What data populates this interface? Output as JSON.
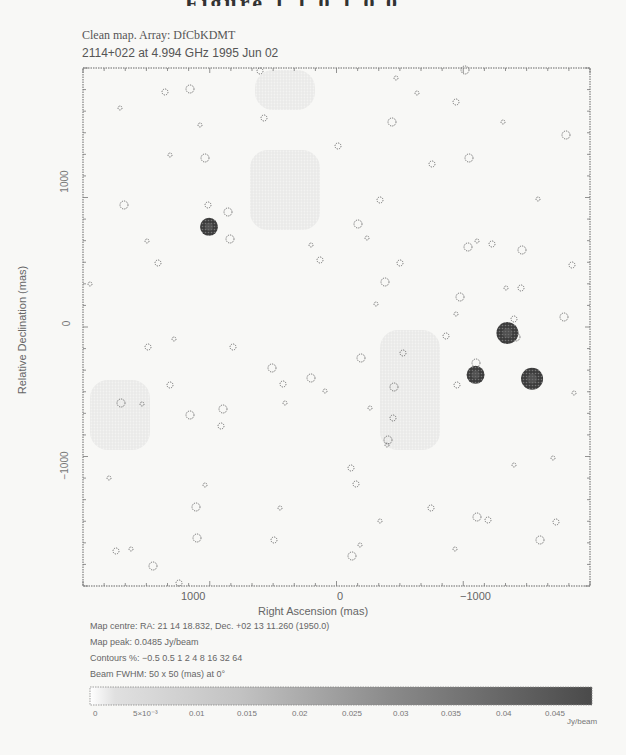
{
  "page": {
    "header_fragment": "Figure  1 1 0 1 0 0"
  },
  "chart_data": {
    "type": "contour-map",
    "title": "Clean map.  Array: DfCbKDMT",
    "subtitle": "2114+022 at 4.994 GHz 1995 Jun 02",
    "xlabel": "Right Ascension   (mas)",
    "ylabel": "Relative Declination   (mas)",
    "xlim": [
      1950,
      -1550
    ],
    "ylim": [
      -1800,
      2050
    ],
    "x_ticks": [
      {
        "value": 1000,
        "label": "1000"
      },
      {
        "value": 0,
        "label": "0"
      },
      {
        "value": -1000,
        "label": "−1000"
      }
    ],
    "y_ticks": [
      {
        "value": 1000,
        "label": "1000"
      },
      {
        "value": 0,
        "label": "0"
      },
      {
        "value": -1000,
        "label": "−1000"
      }
    ],
    "grid": false,
    "bright_sources": [
      {
        "ra_mas": 1080,
        "dec_mas": 870,
        "radius_px": 9
      },
      {
        "ra_mas": -980,
        "dec_mas": 80,
        "radius_px": 11
      },
      {
        "ra_mas": -760,
        "dec_mas": -230,
        "radius_px": 9
      },
      {
        "ra_mas": -1150,
        "dec_mas": -260,
        "radius_px": 11
      }
    ],
    "info": {
      "map_centre": "Map centre:  RA: 21 14 18.832,   Dec. +02 13 11.260 (1950.0)",
      "map_peak": "Map peak: 0.0485 Jy/beam",
      "contours": "Contours %: −0.5 0.5 1 2 4 8 16 32 64",
      "beam": "Beam FWHM: 50 x 50 (mas) at 0°"
    },
    "colorbar": {
      "range": [
        0,
        0.0485
      ],
      "unit": "Jy/beam",
      "ticks": [
        "0",
        "5×10⁻³",
        "0.01",
        "0.015",
        "0.02",
        "0.025",
        "0.03",
        "0.035",
        "0.04",
        "0.045"
      ]
    },
    "contour_noise_blobs": [
      [
        120,
        108
      ],
      [
        165,
        92
      ],
      [
        190,
        89
      ],
      [
        200,
        125
      ],
      [
        260,
        71
      ],
      [
        205,
        158
      ],
      [
        170,
        155
      ],
      [
        208,
        205
      ],
      [
        230,
        239
      ],
      [
        147,
        241
      ],
      [
        158,
        263
      ],
      [
        124,
        205
      ],
      [
        90,
        284
      ],
      [
        264,
        118
      ],
      [
        228,
        212
      ],
      [
        311,
        245
      ],
      [
        320,
        260
      ],
      [
        358,
        224
      ],
      [
        367,
        238
      ],
      [
        400,
        263
      ],
      [
        385,
        282
      ],
      [
        376,
        304
      ],
      [
        380,
        200
      ],
      [
        392,
        122
      ],
      [
        396,
        78
      ],
      [
        338,
        146
      ],
      [
        465,
        70
      ],
      [
        417,
        93
      ],
      [
        456,
        102
      ],
      [
        469,
        158
      ],
      [
        503,
        122
      ],
      [
        432,
        164
      ],
      [
        460,
        297
      ],
      [
        456,
        314
      ],
      [
        446,
        336
      ],
      [
        361,
        358
      ],
      [
        370,
        408
      ],
      [
        403,
        353
      ],
      [
        468,
        247
      ],
      [
        477,
        241
      ],
      [
        492,
        244
      ],
      [
        522,
        250
      ],
      [
        506,
        288
      ],
      [
        521,
        288
      ],
      [
        566,
        135
      ],
      [
        538,
        199
      ],
      [
        572,
        265
      ],
      [
        564,
        317
      ],
      [
        574,
        393
      ],
      [
        514,
        319
      ],
      [
        516,
        337
      ],
      [
        553,
        458
      ],
      [
        556,
        522
      ],
      [
        540,
        540
      ],
      [
        514,
        465
      ],
      [
        488,
        520
      ],
      [
        477,
        517
      ],
      [
        455,
        549
      ],
      [
        457,
        385
      ],
      [
        476,
        363
      ],
      [
        470,
        378
      ],
      [
        393,
        418
      ],
      [
        394,
        387
      ],
      [
        387,
        445
      ],
      [
        356,
        484
      ],
      [
        388,
        440
      ],
      [
        380,
        521
      ],
      [
        431,
        508
      ],
      [
        352,
        556
      ],
      [
        360,
        545
      ],
      [
        351,
        468
      ],
      [
        121,
        403
      ],
      [
        142,
        404
      ],
      [
        170,
        385
      ],
      [
        190,
        415
      ],
      [
        205,
        485
      ],
      [
        179,
        583
      ],
      [
        153,
        566
      ],
      [
        131,
        549
      ],
      [
        116,
        551
      ],
      [
        196,
        507
      ],
      [
        109,
        478
      ],
      [
        221,
        426
      ],
      [
        272,
        368
      ],
      [
        285,
        403
      ],
      [
        233,
        347
      ],
      [
        311,
        378
      ],
      [
        325,
        391
      ],
      [
        283,
        384
      ],
      [
        223,
        409
      ],
      [
        174,
        339
      ],
      [
        148,
        347
      ],
      [
        197,
        538
      ],
      [
        280,
        508
      ],
      [
        274,
        540
      ]
    ],
    "diffuse_regions": [
      {
        "x": 255,
        "y": 70,
        "w": 60,
        "h": 40
      },
      {
        "x": 250,
        "y": 150,
        "w": 70,
        "h": 80
      },
      {
        "x": 380,
        "y": 330,
        "w": 60,
        "h": 120
      },
      {
        "x": 90,
        "y": 380,
        "w": 60,
        "h": 70
      }
    ]
  }
}
